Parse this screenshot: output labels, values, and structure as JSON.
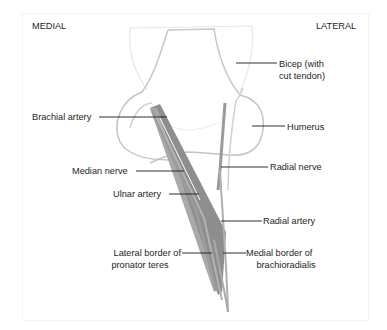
{
  "orientation": {
    "left": "MEDIAL",
    "right": "LATERAL"
  },
  "labels": {
    "bicep": [
      "Bicep (with",
      "cut tendon)"
    ],
    "humerus": "Humerus",
    "brachial_artery": "Brachial artery",
    "median_nerve": "Median nerve",
    "radial_nerve": "Radial nerve",
    "ulnar_artery": "Ulnar artery",
    "radial_artery": "Radial artery",
    "lateral_border": [
      "Lateral border of",
      "pronator teres"
    ],
    "medial_border": [
      "Medial border of",
      "brachioradialis"
    ]
  },
  "colors": {
    "outline_light": "#d6d6d6",
    "outline_mid": "#b5b5b5",
    "vessel_dark": "#8a8a8a",
    "vessel_mid": "#a3a3a3",
    "leader": "#1a1a1a"
  }
}
